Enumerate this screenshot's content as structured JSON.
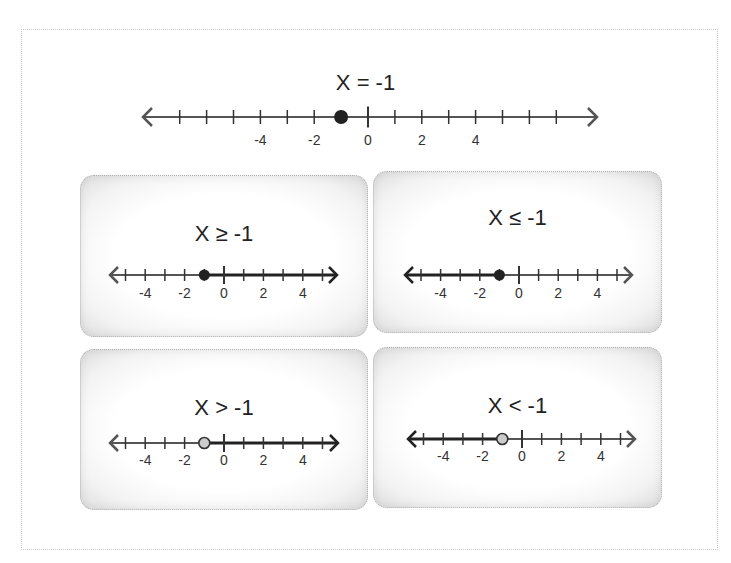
{
  "main": {
    "title": "X = -1",
    "number_line": {
      "min_tick": -7,
      "max_tick": 7,
      "labels": [
        -4,
        -2,
        0,
        2,
        4
      ],
      "point": -1,
      "point_type": "closed",
      "shade": "none"
    }
  },
  "cards": [
    {
      "title": "X ≥ -1",
      "point": -1,
      "point_type": "closed",
      "shade": "right",
      "labels": [
        -4,
        -2,
        0,
        2,
        4
      ],
      "min_tick": -5,
      "max_tick": 5
    },
    {
      "title": "X ≤ -1",
      "point": -1,
      "point_type": "closed",
      "shade": "left",
      "labels": [
        -4,
        -2,
        0,
        2,
        4
      ],
      "min_tick": -5,
      "max_tick": 5
    },
    {
      "title": "X > -1",
      "point": -1,
      "point_type": "open",
      "shade": "right",
      "labels": [
        -4,
        -2,
        0,
        2,
        4
      ],
      "min_tick": -5,
      "max_tick": 5
    },
    {
      "title": "X < -1",
      "point": -1,
      "point_type": "open",
      "shade": "left",
      "labels": [
        -4,
        -2,
        0,
        2,
        4
      ],
      "min_tick": -5,
      "max_tick": 5
    }
  ],
  "colors": {
    "line": "#555555",
    "shaded": "#222222",
    "closed_point": "#222222",
    "open_point_fill": "#cccccc"
  }
}
